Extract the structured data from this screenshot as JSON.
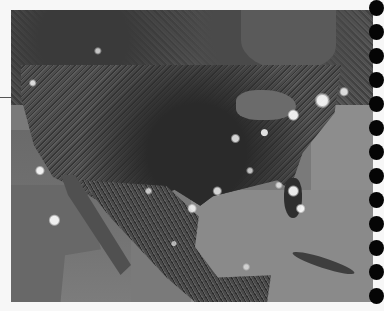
{
  "image": {
    "subject": "Night-time satellite view of North America with city lights",
    "style": "grayscale",
    "colors": {
      "page_background": "#f7f7f7",
      "ocean": "#8a8a8a",
      "land": "#3e3e3e",
      "city_lights": "#ffffff",
      "binding_holes": "#050505"
    }
  },
  "binding": {
    "hole_count": 13,
    "hole_y_positions": [
      8,
      32,
      56,
      80,
      104,
      128,
      152,
      176,
      200,
      224,
      248,
      272,
      296
    ]
  }
}
